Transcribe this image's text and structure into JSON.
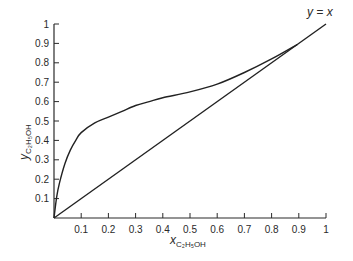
{
  "chart_data": {
    "type": "line",
    "title": "",
    "xlabel": "x_C2H5OH",
    "ylabel": "y_C2H5OH",
    "xlabel_main": "x",
    "ylabel_main": "y",
    "label_subscript": "C₂H₅OH",
    "xlim": [
      0,
      1
    ],
    "ylim": [
      0,
      1
    ],
    "grid": false,
    "x_ticks": [
      "0.1",
      "0.2",
      "0.3",
      "0.4",
      "0.5",
      "0.6",
      "0.7",
      "0.8",
      "0.9",
      "1"
    ],
    "y_ticks": [
      "0.1",
      "0.2",
      "0.3",
      "0.4",
      "0.5",
      "0.6",
      "0.7",
      "0.8",
      "0.9",
      "1"
    ],
    "annotation": "y = x",
    "series": [
      {
        "name": "equilibrium curve",
        "x": [
          0,
          0.01,
          0.02,
          0.04,
          0.06,
          0.08,
          0.1,
          0.15,
          0.2,
          0.25,
          0.3,
          0.35,
          0.4,
          0.5,
          0.6,
          0.7,
          0.8,
          0.894
        ],
        "y": [
          0,
          0.11,
          0.18,
          0.28,
          0.35,
          0.4,
          0.44,
          0.49,
          0.52,
          0.55,
          0.58,
          0.6,
          0.62,
          0.65,
          0.69,
          0.75,
          0.82,
          0.894
        ]
      },
      {
        "name": "y = x",
        "x": [
          0,
          1
        ],
        "y": [
          0,
          1
        ]
      }
    ]
  }
}
